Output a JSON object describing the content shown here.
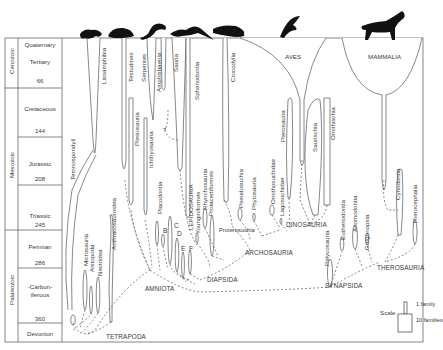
{
  "figure": {
    "line_color": "#555555",
    "text_color": "#3a3a3a",
    "silhouette_color": "#111111"
  },
  "timescale": {
    "eras": [
      {
        "name": "Cenozoic",
        "top": 38,
        "bottom": 88
      },
      {
        "name": "Mesozoic",
        "top": 88,
        "bottom": 230
      },
      {
        "name": "Palaeozoic",
        "top": 230,
        "bottom": 342
      }
    ],
    "periods": [
      {
        "name": "Quaternary",
        "top": 38,
        "bottom": 50
      },
      {
        "name": "Tertiary",
        "top": 50,
        "bottom": 88,
        "base_age": "66"
      },
      {
        "name": "Cretaceous",
        "top": 88,
        "bottom": 137,
        "base_age": "144"
      },
      {
        "name": "Jurassic",
        "top": 137,
        "bottom": 185,
        "base_age": "208"
      },
      {
        "name": "Triassic",
        "top": 185,
        "bottom": 230,
        "base_age": "245"
      },
      {
        "name": "Permian",
        "top": 230,
        "bottom": 268,
        "base_age": "286"
      },
      {
        "name": "-Carbon-\niferous",
        "top": 268,
        "bottom": 323,
        "base_age": "360"
      },
      {
        "name": "Devonion",
        "top": 323,
        "bottom": 342
      }
    ]
  },
  "taxa_labels": [
    {
      "name": "Lissamphibia",
      "x": 104,
      "y": 84
    },
    {
      "name": "Testudines",
      "x": 132,
      "y": 82
    },
    {
      "name": "Serpentes",
      "x": 145,
      "y": 82
    },
    {
      "name": "Amphisbaenia",
      "x": 160,
      "y": 92
    },
    {
      "name": "Sauria",
      "x": 178,
      "y": 76
    },
    {
      "name": "Sphenodontia",
      "x": 200,
      "y": 100
    },
    {
      "name": "Crocodylia",
      "x": 236,
      "y": 83
    },
    {
      "name": "Temnospondyli",
      "x": 71,
      "y": 180
    },
    {
      "name": "Microsauria",
      "x": 87,
      "y": 266
    },
    {
      "name": "Aistopoda",
      "x": 93,
      "y": 271
    },
    {
      "name": "Nectridea",
      "x": 102,
      "y": 275
    },
    {
      "name": "Anthracosauroidea",
      "x": 115,
      "y": 248
    },
    {
      "name": "Plesiosauria",
      "x": 137,
      "y": 146
    },
    {
      "name": "Ichthyosauria",
      "x": 152,
      "y": 168
    },
    {
      "name": "Placodontia",
      "x": 160,
      "y": 213
    },
    {
      "name": "LEPIDOSAURIA",
      "x": 192,
      "y": 227
    },
    {
      "name": "Younginiformes",
      "x": 198,
      "y": 232
    },
    {
      "name": "Rhynchosauria",
      "x": 205,
      "y": 228
    },
    {
      "name": "Prolacertiformes",
      "x": 212,
      "y": 220
    },
    {
      "name": "Pseudosuchia",
      "x": 243,
      "y": 209
    },
    {
      "name": "Phytosauria",
      "x": 257,
      "y": 209
    },
    {
      "name": "Ornithosuchidae",
      "x": 275,
      "y": 208
    },
    {
      "name": "Lagosuchidae",
      "x": 283,
      "y": 212
    },
    {
      "name": "Pterosauria",
      "x": 290,
      "y": 162
    },
    {
      "name": "Saurischia",
      "x": 318,
      "y": 153
    },
    {
      "name": "Ornithischia",
      "x": 335,
      "y": 140
    },
    {
      "name": "Pelycosauria",
      "x": 329,
      "y": 260
    },
    {
      "name": "Eutheriodontia",
      "x": 345,
      "y": 250
    },
    {
      "name": "Anomodontia",
      "x": 356,
      "y": 250
    },
    {
      "name": "Gorgonopsia",
      "x": 368,
      "y": 265
    },
    {
      "name": "Cynodontia",
      "x": 400,
      "y": 185
    },
    {
      "name": "Therocephalia",
      "x": 418,
      "y": 220
    }
  ],
  "major_labels": [
    {
      "name": "AVES",
      "x": 286,
      "y": 53
    },
    {
      "name": "MAMMALIA",
      "x": 371,
      "y": 53
    }
  ],
  "inline_labels": [
    {
      "name": "Proterosuchia",
      "x": 222,
      "y": 225
    },
    {
      "name": "?",
      "x": 168,
      "y": 130
    }
  ],
  "letters": [
    {
      "name": "B",
      "x": 164,
      "y": 225
    },
    {
      "name": "C",
      "x": 175,
      "y": 221
    },
    {
      "name": "D",
      "x": 178,
      "y": 229
    },
    {
      "name": "E",
      "x": 182,
      "y": 244
    },
    {
      "name": "F",
      "x": 190,
      "y": 244
    }
  ],
  "clades": [
    {
      "name": "TETRAPODA",
      "x": 106,
      "y": 337
    },
    {
      "name": "AMNIOTA",
      "x": 145,
      "y": 285
    },
    {
      "name": "DIAPSIDA",
      "x": 207,
      "y": 278
    },
    {
      "name": "ARCHOSAURIA",
      "x": 245,
      "y": 250
    },
    {
      "name": "DINOSAURIA",
      "x": 286,
      "y": 222
    },
    {
      "name": "SYNAPSIDA",
      "x": 325,
      "y": 284
    },
    {
      "name": "THEROSAURIA",
      "x": 378,
      "y": 265
    }
  ],
  "scale": {
    "label": "Scale",
    "one_family": "1 family",
    "ten_families": "10 families"
  },
  "silhouettes": [
    {
      "name": "frog",
      "x": 80
    },
    {
      "name": "turtle",
      "x": 110
    },
    {
      "name": "snake",
      "x": 145
    },
    {
      "name": "lizard",
      "x": 170
    },
    {
      "name": "crocodile",
      "x": 218
    },
    {
      "name": "bird",
      "x": 282
    },
    {
      "name": "horse",
      "x": 362
    }
  ]
}
